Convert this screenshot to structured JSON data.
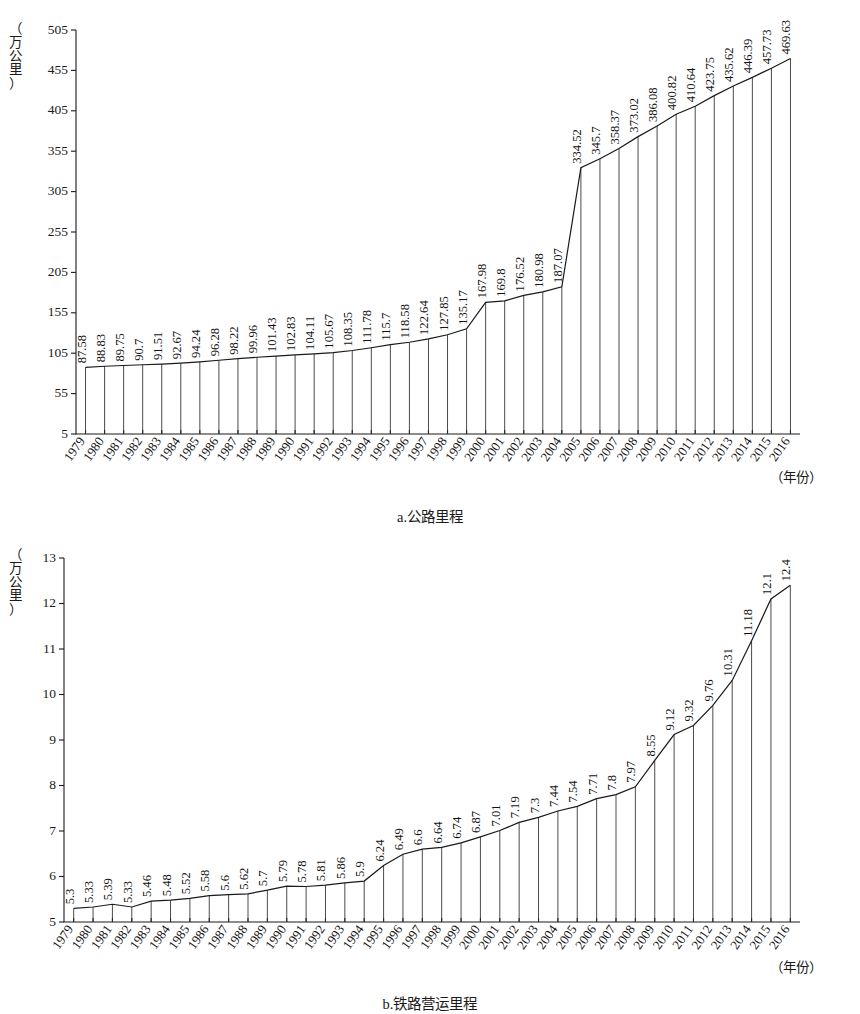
{
  "figure": {
    "charts": [
      {
        "id": "a",
        "caption": "a.公路里程",
        "y_unit_chars": [
          "（",
          "万",
          "公",
          "里",
          "）"
        ],
        "x_unit": "（年份）"
      },
      {
        "id": "b",
        "caption": "b.铁路营运里程",
        "y_unit_chars": [
          "（",
          "万",
          "公",
          "里",
          "）"
        ],
        "x_unit": "（年份）"
      }
    ]
  },
  "chart_data": [
    {
      "type": "line",
      "id": "highway-mileage",
      "title": "a.公路里程",
      "xlabel": "（年份）",
      "ylabel": "（万公里）",
      "ylim": [
        5,
        505
      ],
      "yticks": [
        5,
        55,
        105,
        155,
        205,
        255,
        305,
        355,
        405,
        455,
        505
      ],
      "grid": false,
      "legend": "none",
      "categories": [
        "1979",
        "1980",
        "1981",
        "1982",
        "1983",
        "1984",
        "1985",
        "1986",
        "1987",
        "1988",
        "1989",
        "1990",
        "1991",
        "1992",
        "1993",
        "1994",
        "1995",
        "1996",
        "1997",
        "1998",
        "1999",
        "2000",
        "2001",
        "2002",
        "2003",
        "2004",
        "2005",
        "2006",
        "2007",
        "2008",
        "2009",
        "2010",
        "2011",
        "2012",
        "2013",
        "2014",
        "2015",
        "2016"
      ],
      "values": [
        87.58,
        88.83,
        89.75,
        90.7,
        91.51,
        92.67,
        94.24,
        96.28,
        98.22,
        99.96,
        101.43,
        102.83,
        104.11,
        105.67,
        108.35,
        111.78,
        115.7,
        118.58,
        122.64,
        127.85,
        135.17,
        167.98,
        169.8,
        176.52,
        180.98,
        187.07,
        334.52,
        345.7,
        358.37,
        373.02,
        386.08,
        400.82,
        410.64,
        423.75,
        435.62,
        446.39,
        457.73,
        469.63
      ],
      "data_labels": [
        "87.58",
        "88.83",
        "89.75",
        "90.7",
        "91.51",
        "92.67",
        "94.24",
        "96.28",
        "98.22",
        "99.96",
        "101.43",
        "102.83",
        "104.11",
        "105.67",
        "108.35",
        "111.78",
        "115.7",
        "118.58",
        "122.64",
        "127.85",
        "135.17",
        "167.98",
        "169.8",
        "176.52",
        "180.98",
        "187.07",
        "334.52",
        "345.7",
        "358.37",
        "373.02",
        "386.08",
        "400.82",
        "410.64",
        "423.75",
        "435.62",
        "446.39",
        "457.73",
        "469.63"
      ]
    },
    {
      "type": "line",
      "id": "railway-operating-mileage",
      "title": "b.铁路营运里程",
      "xlabel": "（年份）",
      "ylabel": "（万公里）",
      "ylim": [
        5,
        13
      ],
      "yticks": [
        5,
        6,
        7,
        8,
        9,
        10,
        11,
        12,
        13
      ],
      "grid": false,
      "legend": "none",
      "categories": [
        "1979",
        "1980",
        "1981",
        "1982",
        "1983",
        "1984",
        "1985",
        "1986",
        "1987",
        "1988",
        "1989",
        "1990",
        "1991",
        "1992",
        "1993",
        "1994",
        "1995",
        "1996",
        "1997",
        "1998",
        "1999",
        "2000",
        "2001",
        "2002",
        "2003",
        "2004",
        "2005",
        "2006",
        "2007",
        "2008",
        "2009",
        "2010",
        "2011",
        "2012",
        "2013",
        "2014",
        "2015",
        "2016"
      ],
      "values": [
        5.3,
        5.33,
        5.39,
        5.33,
        5.46,
        5.48,
        5.52,
        5.58,
        5.6,
        5.62,
        5.7,
        5.79,
        5.78,
        5.81,
        5.86,
        5.9,
        6.24,
        6.49,
        6.6,
        6.64,
        6.74,
        6.87,
        7.01,
        7.19,
        7.3,
        7.44,
        7.54,
        7.71,
        7.8,
        7.97,
        8.55,
        9.12,
        9.32,
        9.76,
        10.31,
        11.18,
        12.1,
        12.4
      ],
      "data_labels": [
        "5.3",
        "5.33",
        "5.39",
        "5.33",
        "5.46",
        "5.48",
        "5.52",
        "5.58",
        "5.6",
        "5.62",
        "5.7",
        "5.79",
        "5.78",
        "5.81",
        "5.86",
        "5.9",
        "6.24",
        "6.49",
        "6.6",
        "6.64",
        "6.74",
        "6.87",
        "7.01",
        "7.19",
        "7.3",
        "7.44",
        "7.54",
        "7.71",
        "7.8",
        "7.97",
        "8.55",
        "9.12",
        "9.32",
        "9.76",
        "10.31",
        "11.18",
        "12.1",
        "12.4"
      ]
    }
  ]
}
